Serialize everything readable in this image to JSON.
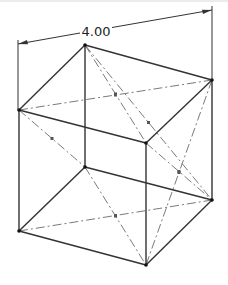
{
  "diagram": {
    "type": "isometric-cube-wireframe",
    "dimension": {
      "label": "4.00",
      "from": [
        18,
        44
      ],
      "to": [
        212,
        10
      ]
    },
    "colors": {
      "edge": "#333333",
      "centerline": "#7a7a7a",
      "dimension": "#333333",
      "border": "#d0d0d0"
    },
    "vertices": {
      "back_top_left": [
        85,
        45
      ],
      "back_top_right": [
        212,
        80
      ],
      "front_top_left": [
        19,
        110
      ],
      "front_top_right": [
        146,
        143
      ],
      "back_bottom_left": [
        85,
        167
      ],
      "back_bottom_right": [
        212,
        200
      ],
      "front_bottom_left": [
        19,
        231
      ],
      "front_bottom_right": [
        146,
        265
      ]
    },
    "edges": [
      [
        "back_top_left",
        "back_top_right"
      ],
      [
        "back_top_left",
        "front_top_left"
      ],
      [
        "back_top_right",
        "front_top_right"
      ],
      [
        "front_top_left",
        "front_top_right"
      ],
      [
        "back_bottom_left",
        "back_bottom_right"
      ],
      [
        "back_bottom_left",
        "front_bottom_left"
      ],
      [
        "back_bottom_right",
        "front_bottom_right"
      ],
      [
        "front_bottom_left",
        "front_bottom_right"
      ],
      [
        "back_top_left",
        "back_bottom_left"
      ],
      [
        "back_top_right",
        "back_bottom_right"
      ],
      [
        "front_top_left",
        "front_bottom_left"
      ],
      [
        "front_top_right",
        "front_bottom_right"
      ]
    ],
    "diagonals": [
      [
        "front_top_left",
        "back_top_right"
      ],
      [
        "back_top_left",
        "front_top_right"
      ],
      [
        "back_top_left",
        "back_bottom_right"
      ],
      [
        "front_top_left",
        "back_bottom_left"
      ],
      [
        "front_bottom_left",
        "back_bottom_right"
      ],
      [
        "back_bottom_left",
        "front_bottom_right"
      ],
      [
        "back_top_right",
        "front_bottom_right"
      ],
      [
        "front_top_right",
        "back_bottom_right"
      ]
    ]
  }
}
